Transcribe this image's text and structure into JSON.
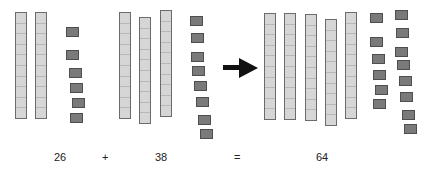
{
  "equation": {
    "addend1": "26",
    "plus": "+",
    "addend2": "38",
    "equals": "=",
    "sum": "64"
  },
  "groups": [
    {
      "name": "addend1",
      "tens": 2,
      "ones": 6
    },
    {
      "name": "addend2",
      "tens": 3,
      "ones": 8
    },
    {
      "name": "sum",
      "tens": 5,
      "ones": 14
    }
  ],
  "colors": {
    "rod_fill": "#d6d6d6",
    "rod_border": "#6b6b6b",
    "unit_fill": "#7a7a7a",
    "arrow": "#111111"
  },
  "arrow_icon": "right-arrow-icon"
}
